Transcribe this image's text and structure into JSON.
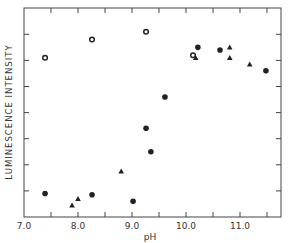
{
  "chart_data": {
    "type": "scatter",
    "title": "",
    "xlabel": "pH",
    "ylabel": "LUMINESCENCE INTENSITY",
    "xlim": [
      7.0,
      11.8
    ],
    "ylim": [
      0,
      8
    ],
    "x_ticks": [
      7.0,
      8.0,
      9.0,
      10.0,
      11.0
    ],
    "x_tick_labels": [
      "7.0",
      "8.0",
      "9.0",
      "10.0",
      "11.0"
    ],
    "x_minor_ticks": [
      7.5,
      8.5,
      9.5,
      10.5,
      11.5
    ],
    "y_tick_labels": [],
    "grid": false,
    "legend": null,
    "series": [
      {
        "name": "open circles",
        "marker": "open-circle",
        "points": [
          [
            7.39,
            6.1
          ],
          [
            8.26,
            6.8
          ],
          [
            9.26,
            7.1
          ],
          [
            10.13,
            6.2
          ]
        ]
      },
      {
        "name": "filled circles",
        "marker": "filled-circle",
        "points": [
          [
            7.39,
            0.9
          ],
          [
            8.26,
            0.85
          ],
          [
            9.02,
            0.6
          ],
          [
            9.26,
            3.4
          ],
          [
            9.35,
            2.5
          ],
          [
            9.61,
            4.6
          ],
          [
            10.22,
            6.5
          ],
          [
            10.63,
            6.4
          ],
          [
            11.48,
            5.6
          ]
        ]
      },
      {
        "name": "filled triangles",
        "marker": "filled-triangle",
        "points": [
          [
            7.89,
            0.45
          ],
          [
            8.0,
            0.7
          ],
          [
            8.8,
            1.75
          ],
          [
            10.18,
            6.1
          ],
          [
            10.81,
            6.5
          ],
          [
            10.81,
            6.1
          ],
          [
            11.18,
            5.85
          ]
        ]
      }
    ]
  },
  "colors": {
    "ink": "#222222",
    "axis": "#444444"
  }
}
